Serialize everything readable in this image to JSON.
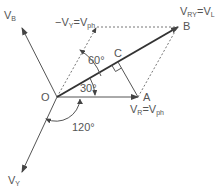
{
  "diagram": {
    "colors": {
      "line": "#555555",
      "bold_line": "#333333",
      "dashed": "#777777",
      "text": "#555555"
    },
    "points": {
      "O": {
        "label": "O",
        "x": 57,
        "y": 97
      },
      "A": {
        "label": "A",
        "x": 138,
        "y": 97
      },
      "B": {
        "label": "B",
        "x": 178,
        "y": 27
      },
      "C": {
        "label": "C",
        "x": 118,
        "y": 62
      }
    },
    "phasors": {
      "VB": {
        "main": "V",
        "sub": "B"
      },
      "VY": {
        "main": "V",
        "sub": "Y"
      },
      "VR": {
        "main": "V",
        "sub": "R",
        "eq": "=",
        "main2": "V",
        "sub2": "ph"
      },
      "VRY": {
        "main": "V",
        "sub": "RY",
        "eq": "=",
        "main2": "V",
        "sub2": "L"
      },
      "negVY": {
        "prefix": "−",
        "main": "V",
        "sub": "Y",
        "eq": "=",
        "main2": "V",
        "sub2": "ph"
      }
    },
    "angles": {
      "a30": "30°",
      "a60": "60°",
      "a120": "120°"
    }
  }
}
